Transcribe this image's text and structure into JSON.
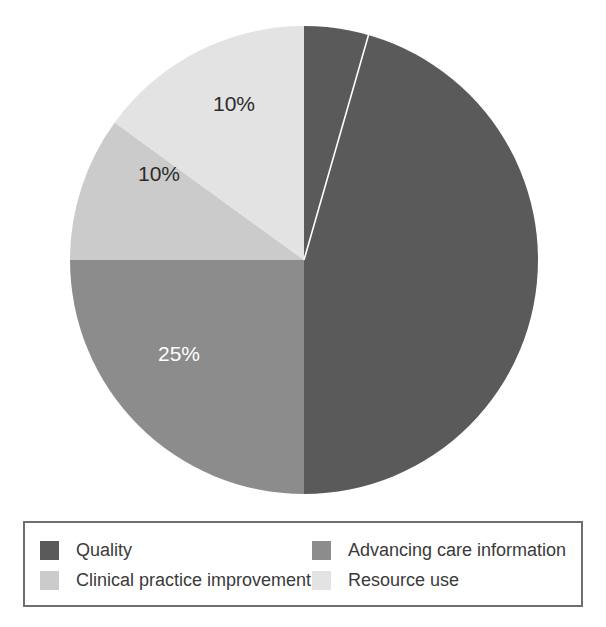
{
  "chart_data": {
    "type": "pie",
    "title": "",
    "subtitle": "",
    "xlabel": "",
    "ylabel": "",
    "grid": false,
    "legend_position": "bottom",
    "start_angle_deg": 0,
    "direction": "clockwise",
    "categories": [
      "Quality",
      "Advancing care information",
      "Clinical practice improvement",
      "Resource use"
    ],
    "values": [
      50,
      25,
      10,
      10
    ],
    "data_labels": [
      "50%",
      "25%",
      "10%",
      "10%"
    ],
    "colors": [
      "#5a5a5a",
      "#8c8c8c",
      "#cbcbcb",
      "#e3e3e3"
    ],
    "slices": [
      {
        "label": "Quality",
        "value": 50,
        "data_label": "50%",
        "color": "#5a5a5a",
        "label_color": "#ffffff",
        "start_deg": 0,
        "end_deg": 180
      },
      {
        "label": "Advancing care information",
        "value": 25,
        "data_label": "25%",
        "color": "#8c8c8c",
        "label_color": "#ffffff",
        "start_deg": 180,
        "end_deg": 270
      },
      {
        "label": "Clinical practice improvement",
        "value": 10,
        "data_label": "10%",
        "color": "#cbcbcb",
        "label_color": "#2b2b2b",
        "start_deg": 270,
        "end_deg": 306
      },
      {
        "label": "Resource use",
        "value": 10,
        "data_label": "10%",
        "color": "#e3e3e3",
        "label_color": "#2b2b2b",
        "start_deg": 306,
        "end_deg": 360
      }
    ]
  },
  "pie": {
    "center_x": 235,
    "center_y": 235,
    "radius": 234,
    "labels": [
      {
        "text": "50%",
        "x": 155,
        "y": 253,
        "tone": "on-dark"
      },
      {
        "text": "25%",
        "x": -125,
        "y": 95,
        "tone": "on-dark"
      },
      {
        "text": "10%",
        "x": -145,
        "y": -85,
        "tone": "on-light"
      },
      {
        "text": "10%",
        "x": -70,
        "y": -155,
        "tone": "on-light"
      }
    ],
    "divider_color": "#ffffff"
  },
  "legend": {
    "border_color": "#6e6e6e",
    "text_color": "#3a3a3a",
    "items": [
      {
        "label": "Quality",
        "color": "#5a5a5a"
      },
      {
        "label": "Advancing care information",
        "color": "#8c8c8c"
      },
      {
        "label": "Clinical practice improvement",
        "color": "#cbcbcb"
      },
      {
        "label": "Resource use",
        "color": "#e3e3e3"
      }
    ]
  }
}
